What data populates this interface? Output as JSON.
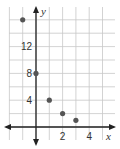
{
  "chart_data": {
    "type": "scatter",
    "title": "",
    "xlabel": "x",
    "ylabel": "y",
    "xlim": [
      -2,
      6
    ],
    "ylim": [
      -2,
      18
    ],
    "grid": true,
    "x_grid_step": 1,
    "y_grid_step": 2,
    "x_ticks": [
      {
        "value": 2,
        "label": "2"
      },
      {
        "value": 4,
        "label": "4"
      }
    ],
    "y_ticks": [
      {
        "value": 4,
        "label": "4"
      },
      {
        "value": 8,
        "label": "8"
      },
      {
        "value": 12,
        "label": "12"
      }
    ],
    "points": [
      {
        "x": -1,
        "y": 16
      },
      {
        "x": 0,
        "y": 8
      },
      {
        "x": 1,
        "y": 4
      },
      {
        "x": 2,
        "y": 2
      },
      {
        "x": 3,
        "y": 1
      }
    ],
    "colors": {
      "grid": "#c8c8c8",
      "axis": "#222222",
      "point": "#555555"
    }
  }
}
